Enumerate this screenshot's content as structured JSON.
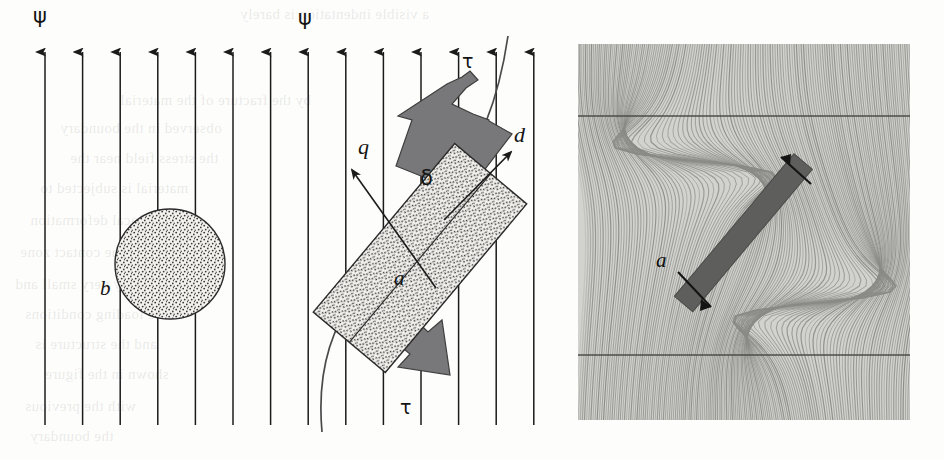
{
  "figure": {
    "domain": "scientific-diagram",
    "width": 944,
    "height": 460,
    "background_color": "#fdfdfc"
  },
  "left_panel": {
    "name": "schematic-diagram",
    "field": {
      "label": "ψ",
      "label_color": "#141414",
      "arrow_count": 14,
      "arrow_color": "#1b1b1b",
      "first_arrow_x": 45,
      "arrow_spacing": 37.6,
      "arrow_top_y": 40,
      "arrow_bottom_y": 425,
      "psi_labels": [
        {
          "text": "ψ",
          "x": 40,
          "y": 16
        },
        {
          "text": "ψ",
          "x": 305,
          "y": 18
        }
      ]
    },
    "circle": {
      "label": "b",
      "center_x": 170,
      "center_y": 264,
      "radius": 55,
      "fill": "stipple",
      "stroke_color": "#2a2a2a",
      "label_x": 104,
      "label_y": 288
    },
    "beam": {
      "label": "a",
      "label_x": 399,
      "label_y": 277,
      "angle_from_vertical_deg": 40,
      "fill": "stipple",
      "stroke_color": "#2a2a2a"
    },
    "shear_arrows": {
      "label": "τ",
      "fill_color": "#78787a",
      "stroke_color": "#3a3a3a",
      "top_label_x": 466,
      "top_label_y": 60,
      "bottom_label_x": 404,
      "bottom_label_y": 405
    },
    "vectors": [
      {
        "label": "q",
        "label_x": 362,
        "label_y": 146,
        "direction": "up-left"
      },
      {
        "label": "d",
        "label_x": 518,
        "label_y": 135,
        "direction": "up-right"
      }
    ],
    "angle": {
      "label": "δ",
      "label_x": 424,
      "label_y": 178
    },
    "deflected_streamline": {
      "name": "curved-field-line",
      "stroke_color": "#4a4a4a"
    }
  },
  "right_panel": {
    "name": "photoelastic-fringe-image",
    "x": 578,
    "y": 44,
    "width": 332,
    "height": 376,
    "background_color": "#cfcfcb",
    "fringe_color": "#8a8a86",
    "bar": {
      "label": "a",
      "label_x": 83,
      "label_y": 218,
      "fill_color": "#5e5e5c",
      "angle_from_vertical_deg": 40
    },
    "reference_lines": [
      {
        "y": 72,
        "color": "#4c4c4a"
      },
      {
        "y": 311,
        "color": "#4c4c4a"
      }
    ],
    "end_arrows": [
      {
        "position": "top",
        "direction": "up-left"
      },
      {
        "position": "bottom",
        "direction": "down-right"
      }
    ]
  },
  "bleed_text": {
    "lines": [
      {
        "text": "a visible indentation is barely",
        "x": 240,
        "y": 6
      },
      {
        "text": "by the fracture of the material",
        "x": 120,
        "y": 92
      },
      {
        "text": "observed in the boundary",
        "x": 60,
        "y": 120
      },
      {
        "text": "the stress field near the",
        "x": 70,
        "y": 150
      },
      {
        "text": "material is subjected to",
        "x": 40,
        "y": 180
      },
      {
        "text": "the local deformation",
        "x": 30,
        "y": 212
      },
      {
        "text": "of the contact zone",
        "x": 20,
        "y": 244
      },
      {
        "text": "normally very small and",
        "x": 15,
        "y": 276
      },
      {
        "text": "the loading conditions",
        "x": 25,
        "y": 306
      },
      {
        "text": "and the structure is",
        "x": 35,
        "y": 336
      },
      {
        "text": "shown in the figure",
        "x": 45,
        "y": 366
      },
      {
        "text": "with the previous",
        "x": 25,
        "y": 398
      },
      {
        "text": "the boundary",
        "x": 30,
        "y": 428
      }
    ]
  }
}
